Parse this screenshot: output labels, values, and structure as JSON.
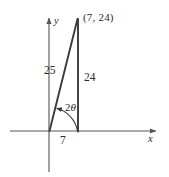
{
  "figure": {
    "stroke_color": "#3a3a3a",
    "axis_color": "#555555",
    "text_color": "#2b2b2b",
    "background": "#ffffff"
  },
  "axes": {
    "x_label": "x",
    "y_label": "y",
    "origin": {
      "x": 49,
      "y": 131
    },
    "x_axis": {
      "x_start": 10,
      "x_end": 158,
      "y": 131,
      "arrow": "right"
    },
    "y_axis": {
      "x": 49,
      "y_start": 16,
      "y_end": 172,
      "arrow": "up"
    }
  },
  "triangle": {
    "vertices": [
      {
        "name": "origin",
        "x": 49,
        "y": 131
      },
      {
        "name": "foot",
        "x": 78,
        "y": 131
      },
      {
        "name": "apex",
        "x": 78,
        "y": 19
      }
    ],
    "apex_point_label": "(7, 24)",
    "hypotenuse_label": "25",
    "vertical_leg_label": "24",
    "horizontal_leg_label": "7"
  },
  "angle": {
    "number": "2",
    "symbol": "θ",
    "full_label": "2θ",
    "vertex": {
      "x": 49,
      "y": 131
    },
    "arc_radius": 28,
    "arrow": "to-hypotenuse"
  },
  "labels": {
    "apex_point": {
      "text": "(7, 24)",
      "left": 83,
      "top": 12
    },
    "hypotenuse": {
      "text": "25",
      "left": 44,
      "top": 65
    },
    "vertical_leg": {
      "text": "24",
      "left": 84,
      "top": 72
    },
    "horizontal_leg": {
      "text": "7",
      "left": 60,
      "top": 135
    },
    "y_axis": {
      "text": "y",
      "left": 54,
      "top": 16
    },
    "x_axis": {
      "text": "x",
      "left": 148,
      "top": 134
    }
  }
}
